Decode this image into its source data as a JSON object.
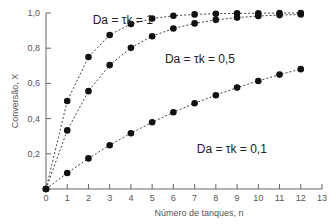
{
  "chart_data": {
    "type": "line",
    "title": "",
    "xlabel": "Número de tanques, n",
    "ylabel": "Conversão, X",
    "xlim": [
      0,
      13
    ],
    "ylim": [
      0,
      1.0
    ],
    "x_ticks": [
      "0",
      "1",
      "2",
      "3",
      "4",
      "5",
      "6",
      "7",
      "8",
      "9",
      "10",
      "11",
      "12",
      "13"
    ],
    "y_ticks": [
      "0,2",
      "0,4",
      "0,6",
      "0,8",
      "1,0"
    ],
    "grid": false,
    "legend": "none (inline annotations)",
    "series": [
      {
        "name": "Da = τk = 1",
        "x": [
          0,
          1,
          2,
          3,
          4,
          5,
          6,
          7,
          8,
          9,
          10,
          11,
          12
        ],
        "values": [
          0,
          0.5,
          0.75,
          0.875,
          0.9375,
          0.969,
          0.984,
          0.992,
          0.996,
          0.998,
          0.999,
          1.0,
          1.0
        ]
      },
      {
        "name": "Da = τk = 0,5",
        "x": [
          0,
          1,
          2,
          3,
          4,
          5,
          6,
          7,
          8,
          9,
          10,
          11,
          12
        ],
        "values": [
          0,
          0.333,
          0.556,
          0.704,
          0.802,
          0.868,
          0.912,
          0.941,
          0.961,
          0.974,
          0.983,
          0.988,
          0.992
        ]
      },
      {
        "name": "Da = τk = 0,1",
        "x": [
          0,
          1,
          2,
          3,
          4,
          5,
          6,
          7,
          8,
          9,
          10,
          11,
          12
        ],
        "values": [
          0,
          0.091,
          0.174,
          0.249,
          0.317,
          0.379,
          0.436,
          0.487,
          0.533,
          0.576,
          0.614,
          0.65,
          0.681
        ]
      }
    ],
    "annotations": [
      {
        "text": "Da = τk = 1",
        "x": 2.2,
        "y": 0.96
      },
      {
        "text": "Da = τk = 0,5",
        "x": 5.6,
        "y": 0.74
      },
      {
        "text": "Da = τk = 0,1",
        "x": 7.1,
        "y": 0.23
      }
    ]
  }
}
